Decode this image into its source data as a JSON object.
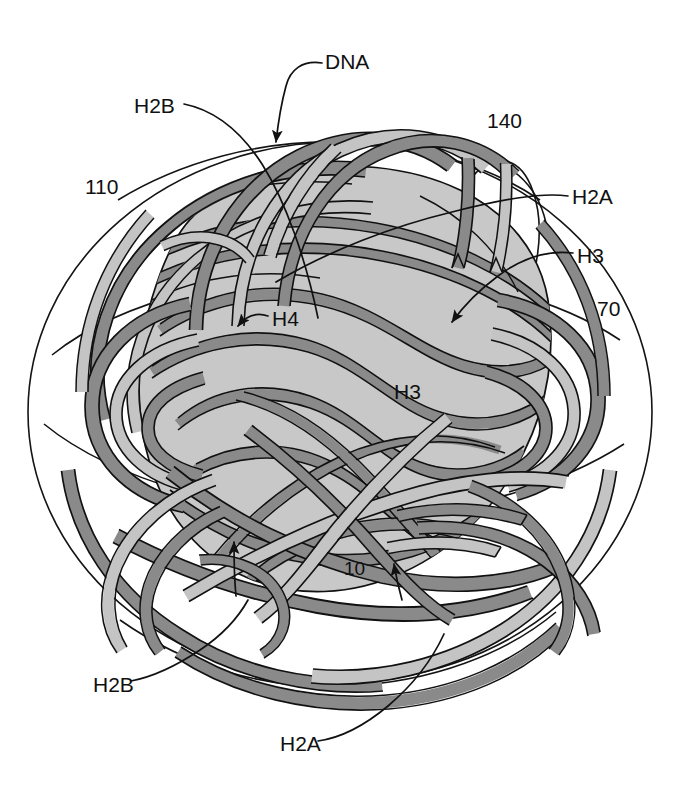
{
  "figure": {
    "kind": "patent-line-drawing",
    "background_color": "#ffffff",
    "ink_color": "#111111",
    "core_fill_color": "#c8c8c8",
    "ribbon_dark_color": "#8a8a8a",
    "ribbon_light_color": "#c4c4c4",
    "ribbon_outline_color": "#111111"
  },
  "labels": [
    {
      "id": "dna",
      "text": "DNA",
      "x": 325,
      "y": 63,
      "anchor": "start",
      "has_leader": true,
      "has_arrow": true
    },
    {
      "id": "h2b-top",
      "text": "H2B",
      "x": 134,
      "y": 107,
      "anchor": "start",
      "has_leader": true,
      "has_arrow": false
    },
    {
      "id": "n140",
      "text": "140",
      "x": 487,
      "y": 122,
      "anchor": "start",
      "has_leader": false,
      "has_arrow": false
    },
    {
      "id": "n110",
      "text": "110",
      "x": 85,
      "y": 188,
      "anchor": "start",
      "has_leader": false,
      "has_arrow": false
    },
    {
      "id": "h2a-right",
      "text": "H2A",
      "x": 572,
      "y": 198,
      "anchor": "start",
      "has_leader": true,
      "has_arrow": false
    },
    {
      "id": "h3-right",
      "text": "H3",
      "x": 577,
      "y": 257,
      "anchor": "start",
      "has_leader": true,
      "has_arrow": true
    },
    {
      "id": "n70",
      "text": "70",
      "x": 597,
      "y": 310,
      "anchor": "start",
      "has_leader": false,
      "has_arrow": false
    },
    {
      "id": "h4",
      "text": "H4",
      "x": 272,
      "y": 320,
      "anchor": "start",
      "has_leader": true,
      "has_arrow": true
    },
    {
      "id": "h3-center",
      "text": "H3",
      "x": 394,
      "y": 393,
      "anchor": "start",
      "has_leader": false,
      "has_arrow": false
    },
    {
      "id": "n10",
      "text": "10",
      "x": 344,
      "y": 570,
      "anchor": "start",
      "has_leader": false,
      "has_arrow": false
    },
    {
      "id": "h2b-bottom",
      "text": "H2B",
      "x": 93,
      "y": 686,
      "anchor": "start",
      "has_leader": true,
      "has_arrow": false
    },
    {
      "id": "h2a-bottom",
      "text": "H2A",
      "x": 280,
      "y": 745,
      "anchor": "start",
      "has_leader": true,
      "has_arrow": false
    }
  ]
}
